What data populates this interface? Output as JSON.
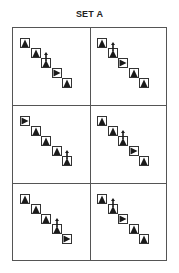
{
  "title": "SET A",
  "cells": [
    {
      "id": "cell-1",
      "sequence": [
        "up",
        "up",
        "up-arrow",
        "right",
        "up"
      ]
    },
    {
      "id": "cell-2",
      "sequence": [
        "up",
        "up-arrow",
        "right",
        "up",
        "up"
      ]
    },
    {
      "id": "cell-3",
      "sequence": [
        "right",
        "up",
        "up",
        "up",
        "up-arrow"
      ]
    },
    {
      "id": "cell-4",
      "sequence": [
        "up",
        "up",
        "up-arrow",
        "right",
        "up"
      ]
    },
    {
      "id": "cell-5",
      "sequence": [
        "up",
        "up",
        "up",
        "up-arrow",
        "right"
      ]
    },
    {
      "id": "cell-6",
      "sequence": [
        "up",
        "up-arrow",
        "right",
        "up",
        "up"
      ]
    }
  ],
  "colors": {
    "line": "#555555",
    "glyph": "#1a1a1a"
  }
}
